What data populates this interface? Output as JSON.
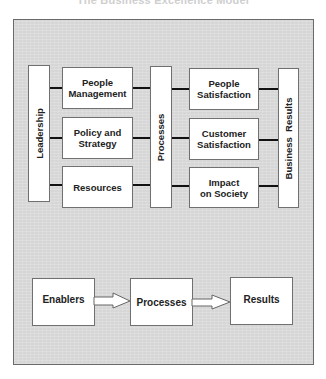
{
  "title": "The Business Excellence Model",
  "model": {
    "leadership": "Leadership",
    "enablers": [
      {
        "line1": "People",
        "line2": "Management"
      },
      {
        "line1": "Policy and",
        "line2": "Strategy"
      },
      {
        "line1": "Resources",
        "line2": ""
      }
    ],
    "processes": "Processes",
    "results": [
      {
        "line1": "People",
        "line2": "Satisfaction"
      },
      {
        "line1": "Customer",
        "line2": "Satisfaction"
      },
      {
        "line1": "Impact",
        "line2": "on Society"
      }
    ],
    "business_results": "Business  Results"
  },
  "flow": {
    "steps": [
      "Enablers",
      "Processes",
      "Results"
    ]
  },
  "colors": {
    "background": "#d6d6d6",
    "box_fill": "#ffffff",
    "border": "#707070",
    "connector": "#111111"
  }
}
